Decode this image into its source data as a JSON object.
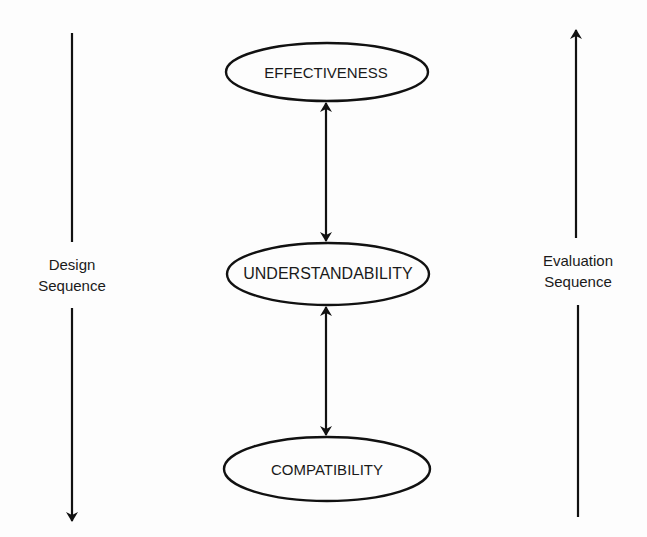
{
  "diagram": {
    "nodes": [
      {
        "id": "effectiveness",
        "label": "EFFECTIVENESS"
      },
      {
        "id": "understandability",
        "label": "UNDERSTANDABILITY"
      },
      {
        "id": "compatibility",
        "label": "COMPATIBILITY"
      }
    ],
    "edges": [
      {
        "from": "effectiveness",
        "to": "understandability",
        "type": "bidirectional"
      },
      {
        "from": "understandability",
        "to": "compatibility",
        "type": "bidirectional"
      }
    ],
    "left_axis": {
      "line1": "Design",
      "line2": "Sequence",
      "direction": "down"
    },
    "right_axis": {
      "line1": "Evaluation",
      "line2": "Sequence",
      "direction": "up"
    },
    "colors": {
      "stroke": "#111111",
      "text": "#1a1a1a",
      "background": "#fdfdfd"
    }
  }
}
